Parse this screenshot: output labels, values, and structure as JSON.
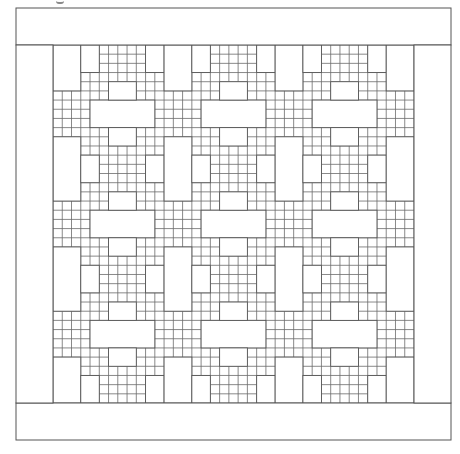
{
  "figure": {
    "line_color": "#555555",
    "grid_line_color": "#6b6b6b",
    "background": "#ffffff",
    "outer_frame": {
      "x": 16,
      "y": 8,
      "w": 435,
      "h": 432
    },
    "border_top": {
      "y": 45
    },
    "border_bottom": {
      "y": 403
    },
    "inner_area": {
      "x": 53,
      "y": 45,
      "w": 361,
      "h": 358
    },
    "grid": {
      "cols": 39,
      "rows": 39
    },
    "tile_period": 12,
    "tile_blanks": [
      {
        "name": "wide-blank",
        "c": 4,
        "r": 6,
        "w": 7,
        "h": 3
      },
      {
        "name": "small-blank-above",
        "c": 6,
        "r": 4,
        "w": 3,
        "h": 2
      },
      {
        "name": "small-blank-below",
        "c": 6,
        "r": 9,
        "w": 3,
        "h": 2
      },
      {
        "name": "tall-blank",
        "c": 0,
        "r": -2,
        "w": 3,
        "h": 7
      },
      {
        "name": "side-blank-left",
        "c": 3,
        "r": 0,
        "w": 2,
        "h": 3
      },
      {
        "name": "side-blank-right",
        "c": 10,
        "r": 0,
        "w": 2,
        "h": 3
      }
    ]
  }
}
